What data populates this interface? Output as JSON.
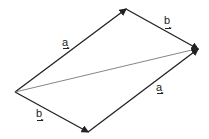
{
  "diagram": {
    "vertices": {
      "left": [
        15,
        92
      ],
      "top": [
        126,
        9
      ],
      "right": [
        198,
        49
      ],
      "bottom": [
        88,
        132
      ]
    },
    "edges": [
      {
        "from": "left",
        "to": "top",
        "label": "a"
      },
      {
        "from": "top",
        "to": "right",
        "label": "b"
      },
      {
        "from": "left",
        "to": "bottom",
        "label": "b"
      },
      {
        "from": "bottom",
        "to": "right",
        "label": "a"
      },
      {
        "from": "left",
        "to": "right",
        "label": "",
        "style": "thin"
      }
    ],
    "labels": {
      "a_upper": "a",
      "b_upper": "b",
      "a_lower": "a",
      "b_lower": "b"
    },
    "colors": {
      "edge": "#222222",
      "diagonal": "#777777"
    }
  }
}
